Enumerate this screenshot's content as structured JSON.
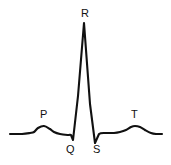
{
  "figure": {
    "name": "ecg-waveform-diagram",
    "background_color": "#ffffff",
    "trace_color": "#111111",
    "label_color": "#111111",
    "width": 171,
    "height": 165
  },
  "labels": {
    "p": "P",
    "q": "Q",
    "r": "R",
    "s": "S",
    "t": "T"
  },
  "chart_data": {
    "type": "line",
    "title": "",
    "xlabel": "",
    "ylabel": "",
    "grid": false,
    "legend": "none",
    "xlim": [
      0,
      171
    ],
    "ylim": [
      165,
      0
    ],
    "annotations": [
      {
        "label": "P",
        "x": 44,
        "y": 126,
        "text_x": 44,
        "text_y": 115
      },
      {
        "label": "Q",
        "x": 73,
        "y": 140,
        "text_x": 70,
        "text_y": 150
      },
      {
        "label": "R",
        "x": 84,
        "y": 23,
        "text_x": 85,
        "text_y": 14
      },
      {
        "label": "S",
        "x": 95,
        "y": 143,
        "text_x": 97,
        "text_y": 150
      },
      {
        "label": "T",
        "x": 135,
        "y": 126,
        "text_x": 135,
        "text_y": 115
      }
    ],
    "series": [
      {
        "name": "ecg-trace",
        "color": "#111111",
        "points": [
          [
            10,
            134
          ],
          [
            22,
            134
          ],
          [
            30,
            133
          ],
          [
            34,
            132
          ],
          [
            38,
            128
          ],
          [
            44,
            126
          ],
          [
            50,
            129
          ],
          [
            54,
            132
          ],
          [
            60,
            134
          ],
          [
            68,
            135
          ],
          [
            71,
            135
          ],
          [
            73,
            140
          ],
          [
            78,
            96
          ],
          [
            84,
            23
          ],
          [
            90,
            104
          ],
          [
            95,
            143
          ],
          [
            99,
            134
          ],
          [
            107,
            133
          ],
          [
            114,
            133
          ],
          [
            120,
            132
          ],
          [
            126,
            130
          ],
          [
            131,
            127
          ],
          [
            135,
            126
          ],
          [
            140,
            127
          ],
          [
            145,
            130
          ],
          [
            151,
            133
          ],
          [
            156,
            134
          ],
          [
            162,
            134
          ]
        ]
      }
    ]
  }
}
